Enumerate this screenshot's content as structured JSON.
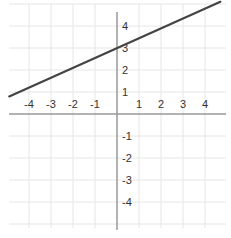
{
  "chart_data": {
    "type": "line",
    "title": "",
    "xlabel": "",
    "ylabel": "",
    "xlim": [
      -4.9,
      4.9
    ],
    "ylim": [
      -5.1,
      5.1
    ],
    "grid": true,
    "x_ticks": [
      "-4",
      "-3",
      "-2",
      "-1",
      "1",
      "2",
      "3",
      "4"
    ],
    "y_ticks": [
      "4",
      "3",
      "2",
      "1",
      "-1",
      "-2",
      "-3",
      "-4"
    ],
    "series": [
      {
        "name": "line",
        "x": [
          -4.9,
          4.7
        ],
        "y": [
          0.8,
          5.1
        ],
        "slope": 0.45,
        "intercept": 2.9,
        "color": "#444444"
      }
    ]
  },
  "colors": {
    "grid": "#e6e6e6",
    "axis": "#999999",
    "line": "#444444",
    "text": "#333333"
  }
}
